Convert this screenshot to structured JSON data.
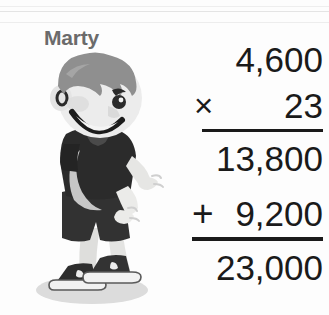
{
  "scene": {
    "background_color": "#fdfdfd",
    "ink_color": "#1a1a1a",
    "label_color": "#6b6b6b"
  },
  "character": {
    "name": "Marty",
    "description": "cartoon boy standing, smiling, arms out",
    "skin_color": "#e9e9e9",
    "hair_color": "#8f8f8f",
    "shirt_color": "#2b2b2b",
    "shorts_color": "#323232",
    "shoe_color": "#2e2e2e",
    "shadow_color": "#d8d8d8"
  },
  "math_problem": {
    "multiplicand": "4,600",
    "multiply_sign": "×",
    "multiplier": "23",
    "partial_product_1": "13,800",
    "plus_sign": "+",
    "partial_product_2": "9,200",
    "total": "23,000"
  }
}
